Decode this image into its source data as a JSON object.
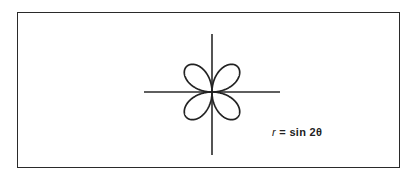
{
  "figure": {
    "equation": {
      "variable": "r",
      "equals": " = ",
      "rhs": "sin 2θ"
    },
    "curve": {
      "type": "rose",
      "formula": "r = sin 2θ",
      "petals": 4,
      "stroke_color": "#222222"
    },
    "axes": {
      "color": "#2a2a2a"
    }
  }
}
